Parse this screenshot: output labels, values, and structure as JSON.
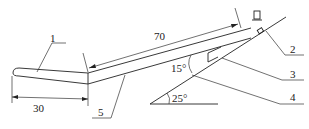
{
  "diagram": {
    "type": "mechanical schematic",
    "parts": [
      {
        "id": "1",
        "label": "1"
      },
      {
        "id": "2",
        "label": "2"
      },
      {
        "id": "3",
        "label": "3"
      },
      {
        "id": "4",
        "label": "4"
      },
      {
        "id": "5",
        "label": "5"
      }
    ],
    "dimensions": {
      "left_length": "30",
      "arm_length": "70"
    },
    "angles": {
      "upper": "15°",
      "base": "25°"
    }
  }
}
